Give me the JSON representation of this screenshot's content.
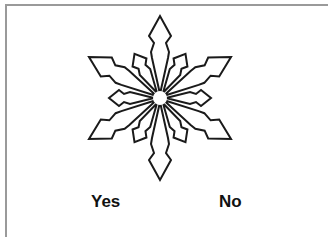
{
  "image": {
    "subject": "snowflake-icon",
    "stroke_color": "#1a1a1a",
    "fill_color": "#ffffff"
  },
  "options": {
    "yes_label": "Yes",
    "no_label": "No"
  },
  "frame": {
    "border_color": "#9a9a9a"
  }
}
